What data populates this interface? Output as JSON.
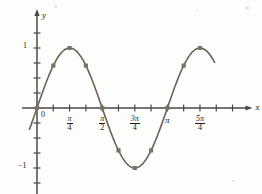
{
  "figure": {
    "title": "",
    "x_axis_label": "x",
    "y_axis_label": "y",
    "origin_label": "0"
  },
  "x_ticks": [
    {
      "id": "origin",
      "display": "0",
      "num": "",
      "den": "",
      "kind": "plain"
    },
    {
      "id": "pi-over-4",
      "display": "π/4",
      "num": "π",
      "den": "4",
      "kind": "fraction"
    },
    {
      "id": "pi-over-2",
      "display": "π/2",
      "num": "π",
      "den": "2",
      "kind": "fraction"
    },
    {
      "id": "three-pi-over-4",
      "display": "3π/4",
      "num": "3π",
      "den": "4",
      "kind": "fraction"
    },
    {
      "id": "pi",
      "display": "π",
      "num": "",
      "den": "",
      "kind": "pi"
    },
    {
      "id": "five-pi-over-4",
      "display": "5π/4",
      "num": "5π",
      "den": "4",
      "kind": "fraction"
    }
  ],
  "y_ticks": [
    {
      "id": "y-one",
      "display": "1"
    },
    {
      "id": "y-neg-one",
      "display": "−1"
    }
  ],
  "colors": {
    "curve": "#6b6257",
    "axis": "#4a4a4a",
    "marker": "#7a7168",
    "text": "#1a1a1a",
    "background": "#fdfdfc"
  },
  "chart_data": {
    "type": "line",
    "title": "",
    "xlabel": "x",
    "ylabel": "y",
    "function": "y = sin(2x)",
    "grid": false,
    "legend": false,
    "xlim": [
      -0.25,
      5.0
    ],
    "ylim": [
      -1.45,
      1.45
    ],
    "x_tick_values": [
      0,
      0.7854,
      1.5708,
      2.3562,
      3.1416,
      3.927
    ],
    "x_tick_labels": [
      "0",
      "π/4",
      "π/2",
      "3π/4",
      "π",
      "5π/4"
    ],
    "y_tick_values": [
      1,
      -1
    ],
    "y_tick_labels": [
      "1",
      "−1"
    ],
    "minor_tick_interval": "π/8",
    "marker_shape": "square",
    "points": [
      {
        "x": 0.0,
        "x_label": "0",
        "y": 0.0
      },
      {
        "x": 0.3927,
        "x_label": "π/8",
        "y": 0.707
      },
      {
        "x": 0.7854,
        "x_label": "π/4",
        "y": 1.0
      },
      {
        "x": 1.1781,
        "x_label": "3π/8",
        "y": 0.707
      },
      {
        "x": 1.5708,
        "x_label": "π/2",
        "y": 0.0
      },
      {
        "x": 1.9635,
        "x_label": "5π/8",
        "y": -0.707
      },
      {
        "x": 2.3562,
        "x_label": "3π/4",
        "y": -1.0
      },
      {
        "x": 2.7489,
        "x_label": "7π/8",
        "y": -0.707
      },
      {
        "x": 3.1416,
        "x_label": "π",
        "y": 0.0
      },
      {
        "x": 3.5343,
        "x_label": "9π/8",
        "y": 0.707
      },
      {
        "x": 3.927,
        "x_label": "5π/4",
        "y": 1.0
      }
    ],
    "curve_domain": [
      -0.18,
      4.28
    ]
  }
}
